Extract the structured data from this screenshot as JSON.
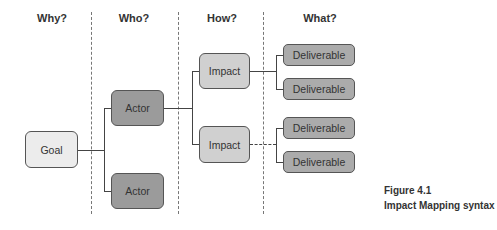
{
  "headers": {
    "why": "Why?",
    "who": "Who?",
    "how": "How?",
    "what": "What?"
  },
  "nodes": {
    "goal": "Goal",
    "actors": [
      "Actor",
      "Actor"
    ],
    "impacts": [
      "Impact",
      "Impact"
    ],
    "deliverables": [
      "Deliverable",
      "Deliverable",
      "Deliverable",
      "Deliverable"
    ]
  },
  "caption": {
    "figure": "Figure 4.1",
    "title": "Impact Mapping syntax"
  },
  "colors": {
    "goal_fill": "#ececec",
    "actor_fill": "#9b9b9b",
    "impact_fill": "#d0d0d0",
    "deliverable_fill": "#ababab",
    "border": "#555555"
  }
}
